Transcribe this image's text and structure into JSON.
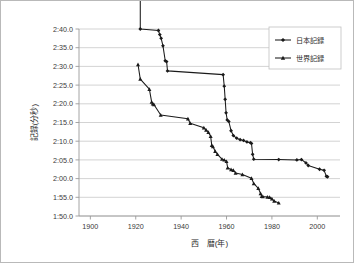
{
  "chart_data": {
    "type": "line",
    "title": "",
    "xlabel": "西　暦(年)",
    "ylabel": "記録(分秒)",
    "xlim": [
      1895,
      2010
    ],
    "ylim_seconds": [
      110,
      160
    ],
    "ylabel_note": "時間は 分:秒.十分の一秒 表記",
    "grid": true,
    "legend_position": "top-right",
    "xticks": [
      1900,
      1920,
      1940,
      1960,
      1980,
      2000
    ],
    "xtick_labels": [
      "1900",
      "1920",
      "1940",
      "1960",
      "1980",
      "2000"
    ],
    "yticks_seconds": [
      110,
      115,
      120,
      125,
      130,
      135,
      140,
      145,
      150,
      155,
      160
    ],
    "ytick_labels": [
      "1:50.0",
      "1:55.0",
      "2:00.0",
      "2:05.0",
      "2:10.0",
      "2:15.0",
      "2:20.0",
      "2:25.0",
      "2:30.0",
      "2:35.0",
      "2:40.0"
    ],
    "series": [
      {
        "name": "日本記録",
        "marker": "diamond",
        "x": [
          1922,
          1922,
          1930,
          1930.6,
          1931.2,
          1932,
          1933,
          1933.6,
          1934,
          1958.5,
          1959,
          1959.4,
          1959.8,
          1960.3,
          1961,
          1962,
          1963,
          1964.5,
          1966,
          1967.5,
          1969,
          1970.5,
          1971,
          1971.5,
          1972,
          1983,
          1991,
          1993,
          1995,
          1996,
          2001,
          2003,
          2004,
          2004.5
        ],
        "y_seconds": [
          168.0,
          160.0,
          159.6,
          158.5,
          157.5,
          155.5,
          151.5,
          151.3,
          148.8,
          147.8,
          144.7,
          141.2,
          137.6,
          135.7,
          135.3,
          132.8,
          131.5,
          130.8,
          130.4,
          130.2,
          129.8,
          129.6,
          129.4,
          126.5,
          125.2,
          125.1,
          125.0,
          125.1,
          124.2,
          123.5,
          122.5,
          122.2,
          120.6,
          120.5
        ],
        "y_labels": [
          "2:48.0",
          "2:40.0",
          "2:39.6",
          "2:38.5",
          "2:37.5",
          "2:35.5",
          "2:31.5",
          "2:31.3",
          "2:28.8",
          "2:27.8",
          "2:24.7",
          "2:21.2",
          "2:17.6",
          "2:15.7",
          "2:15.3",
          "2:12.8",
          "2:11.5",
          "2:10.8",
          "2:10.4",
          "2:10.2",
          "2:09.8",
          "2:09.6",
          "2:09.4",
          "2:06.5",
          "2:05.2",
          "2:05.1",
          "2:05.0",
          "2:05.1",
          "2:04.2",
          "2:03.5",
          "2:02.5",
          "2:02.2",
          "2:00.6",
          "2:00.5"
        ]
      },
      {
        "name": "世界記録",
        "marker": "triangle",
        "x": [
          1921,
          1922,
          1926,
          1927,
          1927.5,
          1928,
          1931,
          1943,
          1944,
          1950,
          1951,
          1952,
          1953,
          1953.5,
          1954,
          1955,
          1956,
          1958,
          1959,
          1960,
          1960.5,
          1962,
          1963,
          1964,
          1967,
          1971,
          1972,
          1974,
          1975,
          1975.5,
          1976,
          1978,
          1979,
          1980,
          1981,
          1983
        ],
        "y_seconds": [
          150.5,
          146.6,
          143.9,
          140.5,
          140.0,
          139.8,
          137.0,
          136.0,
          134.8,
          133.6,
          133.0,
          132.4,
          131.3,
          128.9,
          128.6,
          127.3,
          126.5,
          125.2,
          125.0,
          124.6,
          122.9,
          122.4,
          122.2,
          121.5,
          121.1,
          120.1,
          118.7,
          117.4,
          116.0,
          115.3,
          115.2,
          115.1,
          115.0,
          114.6,
          114.0,
          113.5
        ],
        "y_labels": [
          "2:30.5",
          "2:26.6",
          "2:23.9",
          "2:20.5",
          "2:20.0",
          "2:19.8",
          "2:17.0",
          "2:16.0",
          "2:14.8",
          "2:13.6",
          "2:13.0",
          "2:12.4",
          "2:11.3",
          "2:08.9",
          "2:08.6",
          "2:07.3",
          "2:06.5",
          "2:05.2",
          "2:05.0",
          "2:04.6",
          "2:02.9",
          "2:02.4",
          "2:02.2",
          "2:01.5",
          "2:01.1",
          "2:00.1",
          "1:58.7",
          "1:57.4",
          "1:56.0",
          "1:55.3",
          "1:55.2",
          "1:55.1",
          "1:55.0",
          "1:54.6",
          "1:54.0",
          "1:53.5"
        ]
      }
    ]
  },
  "legend": {
    "items": [
      {
        "label": "日本記録"
      },
      {
        "label": "世界記録"
      }
    ]
  }
}
